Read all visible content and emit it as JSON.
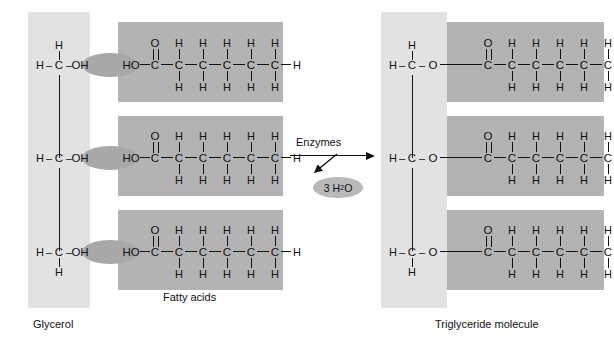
{
  "figure": {
    "colors": {
      "glycerol_panel": "#e2e2e2",
      "fatty_panel": "#b3b3b3",
      "link_ellipse": "#a8a8a8",
      "water_ellipse": "#b9b9b9",
      "bond": "#111111",
      "background": "#ffffff"
    }
  },
  "captions": {
    "glycerol": "Glycerol",
    "fatty_acids": "Fatty acids",
    "triglyceride": "Triglyceride molecule"
  },
  "reaction": {
    "enzymes_label": "Enzymes",
    "byproduct_count": "3",
    "byproduct_formula_main": "H",
    "byproduct_formula_sub": "2",
    "byproduct_formula_tail": "O",
    "byproduct_label": "3 H2O",
    "arrow_direction": "left-to-right"
  },
  "atoms": {
    "H": "H",
    "C": "C",
    "O": "O",
    "OH": "OH",
    "HO": "HO",
    "dash": "–"
  },
  "reactant": {
    "glycerol_rows": [
      {
        "id": "row-1",
        "left_h": "H",
        "dash1": "–",
        "carbon": "C",
        "dash2": "–",
        "hydroxyl": "OH",
        "top_h": "H",
        "bottom_h": ""
      },
      {
        "id": "row-2",
        "left_h": "H",
        "dash1": "–",
        "carbon": "C",
        "dash2": "–",
        "hydroxyl": "OH",
        "top_h": "",
        "bottom_h": ""
      },
      {
        "id": "row-3",
        "left_h": "H",
        "dash1": "–",
        "carbon": "C",
        "dash2": "–",
        "hydroxyl": "OH",
        "top_h": "",
        "bottom_h": "H"
      }
    ],
    "fatty_acid_rows": [
      {
        "id": "fa-1",
        "head": "HO",
        "carbons": [
          "C",
          "C",
          "C",
          "C",
          "C",
          "C"
        ],
        "carbonyl_o": "O",
        "upper_h": [
          "",
          "H",
          "H",
          "H",
          "H",
          "H"
        ],
        "lower_h": [
          "",
          "H",
          "H",
          "H",
          "H",
          "H"
        ],
        "terminal_h": "H"
      },
      {
        "id": "fa-2",
        "head": "HO",
        "carbons": [
          "C",
          "C",
          "C",
          "C",
          "C",
          "C"
        ],
        "carbonyl_o": "O",
        "upper_h": [
          "",
          "H",
          "H",
          "H",
          "H",
          "H"
        ],
        "lower_h": [
          "",
          "H",
          "H",
          "H",
          "H",
          "H"
        ],
        "terminal_h": "H"
      },
      {
        "id": "fa-3",
        "head": "HO",
        "carbons": [
          "C",
          "C",
          "C",
          "C",
          "C",
          "C"
        ],
        "carbonyl_o": "O",
        "upper_h": [
          "",
          "H",
          "H",
          "H",
          "H",
          "H"
        ],
        "lower_h": [
          "",
          "H",
          "H",
          "H",
          "H",
          "H"
        ],
        "terminal_h": "H"
      }
    ]
  },
  "product": {
    "glycerol_rows": [
      {
        "id": "prow-1",
        "left_h": "H",
        "dash1": "–",
        "carbon": "C",
        "dash2": "–",
        "ester_o": "O",
        "top_h": "H",
        "bottom_h": ""
      },
      {
        "id": "prow-2",
        "left_h": "H",
        "dash1": "–",
        "carbon": "C",
        "dash2": "–",
        "ester_o": "O",
        "top_h": "",
        "bottom_h": ""
      },
      {
        "id": "prow-3",
        "left_h": "H",
        "dash1": "–",
        "carbon": "C",
        "dash2": "–",
        "ester_o": "O",
        "top_h": "",
        "bottom_h": "H"
      }
    ],
    "fatty_acid_rows": [
      {
        "id": "pfa-1",
        "carbons": [
          "C",
          "C",
          "C",
          "C",
          "C",
          "C"
        ],
        "carbonyl_o": "O",
        "upper_h": [
          "",
          "H",
          "H",
          "H",
          "H",
          "H"
        ],
        "lower_h": [
          "",
          "H",
          "H",
          "H",
          "H",
          "H"
        ],
        "terminal_h": "H"
      },
      {
        "id": "pfa-2",
        "carbons": [
          "C",
          "C",
          "C",
          "C",
          "C",
          "C"
        ],
        "carbonyl_o": "O",
        "upper_h": [
          "",
          "H",
          "H",
          "H",
          "H",
          "H"
        ],
        "lower_h": [
          "",
          "H",
          "H",
          "H",
          "H",
          "H"
        ],
        "terminal_h": "H"
      },
      {
        "id": "pfa-3",
        "carbons": [
          "C",
          "C",
          "C",
          "C",
          "C",
          "C"
        ],
        "carbonyl_o": "O",
        "upper_h": [
          "",
          "H",
          "H",
          "H",
          "H",
          "H"
        ],
        "lower_h": [
          "",
          "H",
          "H",
          "H",
          "H",
          "H"
        ],
        "terminal_h": "H"
      }
    ]
  }
}
